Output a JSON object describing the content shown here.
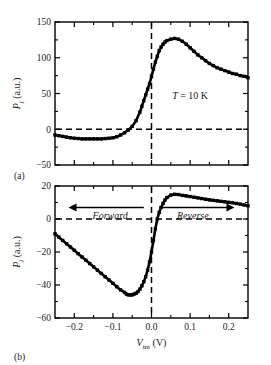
{
  "figure": {
    "panels": [
      {
        "panel_label": "(a)",
        "annotation": "T = 10 K"
      },
      {
        "panel_label": "(b)",
        "arrow_left_label": "Forward",
        "arrow_right_label": "Reverse"
      }
    ],
    "axis_titles": {
      "y_symbol": "P",
      "y_subscript": "j",
      "y_units": "(a.u.)",
      "x_symbol": "V",
      "x_subscript": "int",
      "x_units": "(V)"
    },
    "colors": {
      "ink": "#000000",
      "text": "#1a1a1a",
      "background": "#ffffff"
    }
  },
  "chart_data": [
    {
      "type": "line",
      "title": "",
      "panel": "(a)",
      "xlabel": "V_int (V)",
      "ylabel": "P_j (a.u.)",
      "xlim": [
        -0.25,
        0.25
      ],
      "ylim": [
        -50,
        150
      ],
      "xticks": [
        -0.2,
        -0.1,
        0.0,
        0.1,
        0.2
      ],
      "xticklabels": [
        "−0.2",
        "−0.1",
        "0.0",
        "0.1",
        "0.2"
      ],
      "yticks": [
        -50,
        0,
        50,
        100,
        150
      ],
      "yticklabels": [
        "−50",
        "0",
        "50",
        "100",
        "150"
      ],
      "minor_yticks": [
        -25,
        25,
        75,
        125
      ],
      "grid": false,
      "legend": null,
      "annotations": [
        {
          "text": "T = 10 K",
          "x": 0.1,
          "y": 42
        },
        {
          "text": "zero-line",
          "type": "hline",
          "y": 0,
          "style": "dashed"
        },
        {
          "text": "zero-bias",
          "type": "vline",
          "x": 0.0,
          "style": "dashed"
        }
      ],
      "x": [
        -0.25,
        -0.24,
        -0.23,
        -0.22,
        -0.21,
        -0.2,
        -0.19,
        -0.18,
        -0.17,
        -0.16,
        -0.15,
        -0.14,
        -0.13,
        -0.12,
        -0.11,
        -0.1,
        -0.09,
        -0.08,
        -0.07,
        -0.06,
        -0.05,
        -0.04,
        -0.03,
        -0.025,
        -0.02,
        -0.015,
        -0.01,
        -0.005,
        0.0,
        0.005,
        0.01,
        0.015,
        0.02,
        0.025,
        0.03,
        0.035,
        0.04,
        0.05,
        0.06,
        0.07,
        0.08,
        0.09,
        0.1,
        0.11,
        0.12,
        0.13,
        0.14,
        0.15,
        0.16,
        0.17,
        0.18,
        0.19,
        0.2,
        0.21,
        0.22,
        0.23,
        0.24,
        0.25
      ],
      "values": [
        -8,
        -9,
        -10,
        -11,
        -12,
        -12.5,
        -13,
        -13.5,
        -13.5,
        -13.5,
        -13.5,
        -13.5,
        -13.5,
        -13,
        -12.5,
        -12,
        -10.5,
        -8,
        -5,
        -1,
        4,
        12,
        24,
        32,
        40,
        48,
        56,
        64,
        74,
        84,
        94,
        102,
        110,
        115,
        119,
        122,
        124,
        126,
        127,
        126,
        123,
        119,
        114,
        109,
        104,
        100,
        96,
        92,
        89,
        86,
        84,
        82,
        80,
        78,
        77,
        75,
        74,
        72
      ]
    },
    {
      "type": "line",
      "title": "",
      "panel": "(b)",
      "xlabel": "V_int (V)",
      "ylabel": "P_j (a.u.)",
      "xlim": [
        -0.25,
        0.25
      ],
      "ylim": [
        -60,
        20
      ],
      "xticks": [
        -0.2,
        -0.1,
        0.0,
        0.1,
        0.2
      ],
      "xticklabels": [
        "−0.2",
        "−0.1",
        "0.0",
        "0.1",
        "0.2"
      ],
      "yticks": [
        -60,
        -40,
        -20,
        0,
        20
      ],
      "yticklabels": [
        "−60",
        "−40",
        "−20",
        "0",
        "20"
      ],
      "minor_yticks": [
        -50,
        -30,
        -10,
        10
      ],
      "grid": false,
      "legend": null,
      "annotations": [
        {
          "text": "Forward",
          "type": "arrow-left",
          "x": -0.12,
          "y": 7
        },
        {
          "text": "Reverse",
          "type": "arrow-right",
          "x": 0.12,
          "y": 7
        },
        {
          "text": "zero-line",
          "type": "hline",
          "y": 0,
          "style": "dashed"
        },
        {
          "text": "zero-bias",
          "type": "vline",
          "x": 0.0,
          "style": "dashed"
        }
      ],
      "x": [
        -0.25,
        -0.24,
        -0.23,
        -0.22,
        -0.21,
        -0.2,
        -0.19,
        -0.18,
        -0.17,
        -0.16,
        -0.15,
        -0.14,
        -0.13,
        -0.12,
        -0.11,
        -0.1,
        -0.09,
        -0.08,
        -0.07,
        -0.065,
        -0.06,
        -0.055,
        -0.05,
        -0.045,
        -0.04,
        -0.035,
        -0.03,
        -0.025,
        -0.02,
        -0.015,
        -0.01,
        -0.005,
        0.0,
        0.005,
        0.01,
        0.015,
        0.02,
        0.025,
        0.03,
        0.035,
        0.04,
        0.05,
        0.06,
        0.07,
        0.08,
        0.09,
        0.1,
        0.11,
        0.12,
        0.13,
        0.14,
        0.15,
        0.16,
        0.17,
        0.18,
        0.19,
        0.2,
        0.21,
        0.22,
        0.23,
        0.24,
        0.25
      ],
      "values": [
        -9,
        -11,
        -13,
        -15,
        -17,
        -19,
        -21,
        -23,
        -25,
        -27,
        -29,
        -31,
        -33,
        -35,
        -37,
        -39,
        -41,
        -43,
        -44.5,
        -45.5,
        -46,
        -46,
        -46,
        -45.5,
        -45,
        -44,
        -42.5,
        -40.5,
        -38,
        -35,
        -31,
        -26,
        -20,
        -13,
        -6,
        0,
        4,
        7,
        9.5,
        11.5,
        13,
        14.5,
        15,
        14.8,
        14.3,
        14,
        13.6,
        13.2,
        12.8,
        12.4,
        12,
        11.6,
        11.3,
        11,
        10.7,
        10.4,
        10.1,
        9.8,
        9.4,
        9,
        8.5,
        8
      ]
    }
  ]
}
